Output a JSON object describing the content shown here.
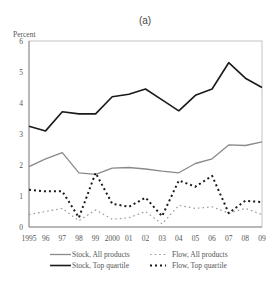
{
  "chart_data": {
    "type": "line",
    "title": "(a)",
    "xlabel": "",
    "ylabel": "Percent",
    "ylim": [
      0,
      6
    ],
    "yticks": [
      "0",
      "1",
      "2",
      "3",
      "4",
      "5",
      "6"
    ],
    "grid": false,
    "legend_position": "bottom",
    "categories": [
      "1995",
      "96",
      "97",
      "98",
      "99",
      "2000",
      "01",
      "02",
      "03",
      "04",
      "05",
      "06",
      "07",
      "08",
      "09"
    ],
    "series": [
      {
        "name": "Stock, All products",
        "style": "solid-thin",
        "color": "#8a8a8a",
        "values": [
          1.95,
          2.2,
          2.4,
          1.75,
          1.7,
          1.9,
          1.92,
          1.87,
          1.8,
          1.75,
          2.05,
          2.2,
          2.65,
          2.63,
          2.75
        ]
      },
      {
        "name": "Stock, Top quartile",
        "style": "solid-thick",
        "color": "#1a1a1a",
        "values": [
          3.25,
          3.1,
          3.72,
          3.65,
          3.65,
          4.2,
          4.28,
          4.45,
          4.1,
          3.75,
          4.25,
          4.45,
          5.3,
          4.8,
          4.5
        ]
      },
      {
        "name": "Flow, All products",
        "style": "dashed-thin",
        "color": "#9a9a9a",
        "values": [
          0.4,
          0.5,
          0.6,
          0.2,
          0.55,
          0.25,
          0.3,
          0.5,
          0.1,
          0.7,
          0.6,
          0.65,
          0.45,
          0.6,
          0.4
        ]
      },
      {
        "name": "Flow, Top quartile",
        "style": "dashed-thick",
        "color": "#1a1a1a",
        "values": [
          1.2,
          1.15,
          1.15,
          0.3,
          1.75,
          0.75,
          0.65,
          0.95,
          0.35,
          1.5,
          1.3,
          1.65,
          0.45,
          0.85,
          0.8
        ]
      }
    ]
  },
  "legend": {
    "items": [
      {
        "label": "Stock,  All products"
      },
      {
        "label": "Stock,  Top quartile"
      },
      {
        "label": "Flow,  All products"
      },
      {
        "label": "Flow,  Top quartile"
      }
    ]
  }
}
